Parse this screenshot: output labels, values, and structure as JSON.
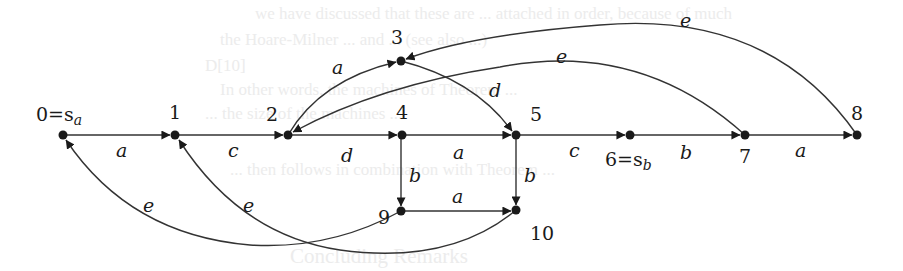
{
  "diagram": {
    "type": "automaton-graph",
    "nodes": [
      {
        "id": "0",
        "label": "0=s",
        "sub": "a",
        "x": 63,
        "y": 135
      },
      {
        "id": "1",
        "label": "1",
        "x": 175,
        "y": 135
      },
      {
        "id": "2",
        "label": "2",
        "x": 288,
        "y": 135
      },
      {
        "id": "3",
        "label": "3",
        "x": 401,
        "y": 61
      },
      {
        "id": "4",
        "label": "4",
        "x": 402,
        "y": 135
      },
      {
        "id": "5",
        "label": "5",
        "x": 516,
        "y": 135
      },
      {
        "id": "6",
        "label": "6=s",
        "sub": "b",
        "x": 630,
        "y": 135
      },
      {
        "id": "7",
        "label": "7",
        "x": 745,
        "y": 135
      },
      {
        "id": "8",
        "label": "8",
        "x": 857,
        "y": 135
      },
      {
        "id": "9",
        "label": "9",
        "x": 401,
        "y": 211
      },
      {
        "id": "10",
        "label": "10",
        "x": 516,
        "y": 210
      }
    ],
    "edges": [
      {
        "from": "0",
        "to": "1",
        "label": "a"
      },
      {
        "from": "1",
        "to": "2",
        "label": "c"
      },
      {
        "from": "2",
        "to": "3",
        "label": "a"
      },
      {
        "from": "2",
        "to": "4",
        "label": "d"
      },
      {
        "from": "3",
        "to": "5",
        "label": "d"
      },
      {
        "from": "4",
        "to": "5",
        "label": "a"
      },
      {
        "from": "4",
        "to": "9",
        "label": "b"
      },
      {
        "from": "5",
        "to": "6",
        "label": "c"
      },
      {
        "from": "5",
        "to": "10",
        "label": "b"
      },
      {
        "from": "6",
        "to": "7",
        "label": "b"
      },
      {
        "from": "7",
        "to": "8",
        "label": "a"
      },
      {
        "from": "9",
        "to": "10",
        "label": "a"
      },
      {
        "from": "7",
        "to": "2",
        "label": "e"
      },
      {
        "from": "8",
        "to": "3",
        "label": "e"
      },
      {
        "from": "9",
        "to": "0",
        "label": "e"
      },
      {
        "from": "10",
        "to": "1",
        "label": "e"
      }
    ]
  },
  "labels": {
    "n0": "0=s",
    "n0_sub": "a",
    "n1": "1",
    "n2": "2",
    "n3": "3",
    "n4": "4",
    "n5": "5",
    "n6": "6=s",
    "n6_sub": "b",
    "n7": "7",
    "n8": "8",
    "n9": "9",
    "n10": "10",
    "e01": "a",
    "e12": "c",
    "e23": "a",
    "e24": "d",
    "e35": "d",
    "e45": "a",
    "e49": "b",
    "e56": "c",
    "e510": "b",
    "e67": "b",
    "e78": "a",
    "e910": "a",
    "e72": "e",
    "e83": "e",
    "e90": "e",
    "e101": "e"
  },
  "bleed_through": {
    "line1": "we have discussed that these are ... attached in order, because of much",
    "line2": "the Hoare-Milner ... and ... (see also ...)",
    "line3": "D[10]",
    "line4": "In other words, the machines of Theorem ...",
    "line5": "... the size of the machines ...",
    "line6": "... then follows in combination with Theorem ...",
    "heading": "Concluding Remarks"
  }
}
